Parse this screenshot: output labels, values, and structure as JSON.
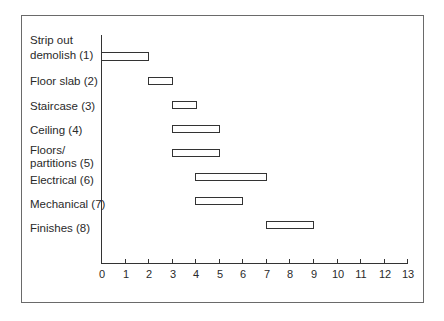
{
  "chart_data": {
    "type": "bar",
    "orientation": "horizontal-gantt",
    "title": "",
    "xlabel": "",
    "ylabel": "",
    "xlim": [
      0,
      13
    ],
    "x_ticks": [
      "0",
      "1",
      "2",
      "3",
      "4",
      "5",
      "6",
      "7",
      "8",
      "9",
      "10",
      "11",
      "12",
      "13"
    ],
    "grid": false,
    "legend": null,
    "categories": [
      "Strip out demolish (1)",
      "Floor slab (2)",
      "Staircase (3)",
      "Ceiling (4)",
      "Floors/ partitions (5)",
      "Electrical (6)",
      "Mechanical (7)",
      "Finishes (8)"
    ],
    "series": [
      {
        "name": "start",
        "values": [
          0,
          2,
          3,
          3,
          3,
          4,
          4,
          7
        ]
      },
      {
        "name": "end",
        "values": [
          2,
          3,
          4,
          5,
          5,
          7,
          6,
          9
        ]
      }
    ]
  },
  "labels": {
    "l1a": "Strip out",
    "l1b": "demolish (1)",
    "l2": "Floor slab (2)",
    "l3": "Staircase (3)",
    "l4": "Ceiling (4)",
    "l5a": "Floors/",
    "l5b": "partitions (5)",
    "l6": "Electrical (6)",
    "l7": "Mechanical (7)",
    "l8": "Finishes (8)"
  },
  "ticks": [
    "0",
    "1",
    "2",
    "3",
    "4",
    "5",
    "6",
    "7",
    "8",
    "9",
    "10",
    "11",
    "12",
    "13"
  ]
}
